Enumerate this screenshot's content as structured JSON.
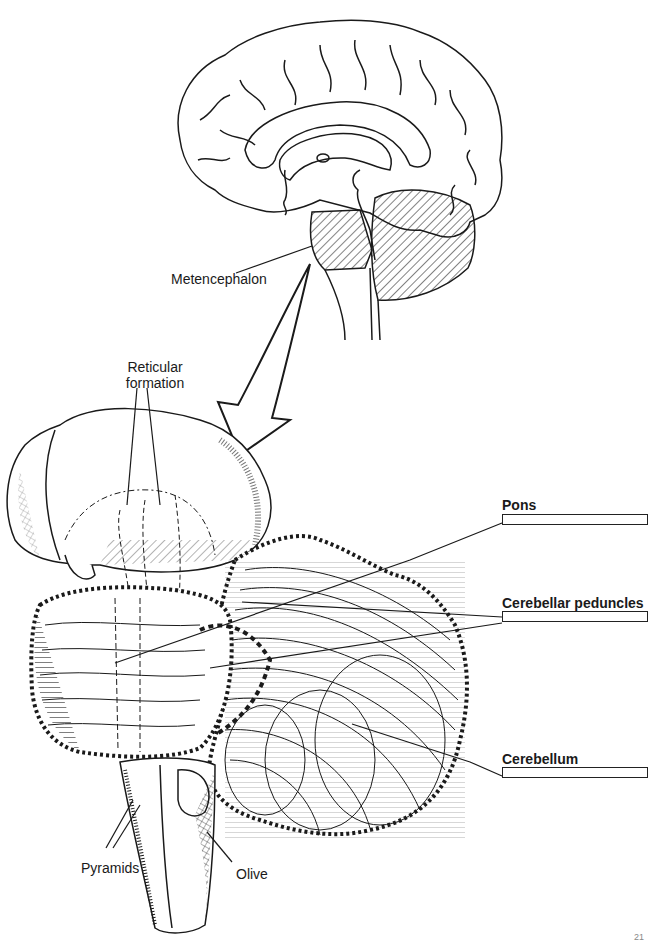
{
  "diagram": {
    "colors": {
      "ink": "#1a1a1a",
      "background": "#ffffff"
    },
    "top_figure": {
      "name": "Sagittal section of brain",
      "label": "Metencephalon"
    },
    "arrow": {
      "direction": "down-left",
      "meaning": "enlarged view"
    },
    "bottom_figure": {
      "name": "Brainstem and cerebellum, lateral view",
      "plain_labels": [
        {
          "id": "reticular_formation",
          "text_line1": "Reticular",
          "text_line2": "formation"
        },
        {
          "id": "pyramids",
          "text": "Pyramids"
        },
        {
          "id": "olive",
          "text": "Olive"
        }
      ],
      "fill_in_labels": [
        {
          "id": "pons",
          "text": "Pons",
          "answer": ""
        },
        {
          "id": "cerebellar_peduncles",
          "text": "Cerebellar peduncles",
          "answer": ""
        },
        {
          "id": "cerebellum",
          "text": "Cerebellum",
          "answer": ""
        }
      ]
    },
    "page_number": "21"
  }
}
